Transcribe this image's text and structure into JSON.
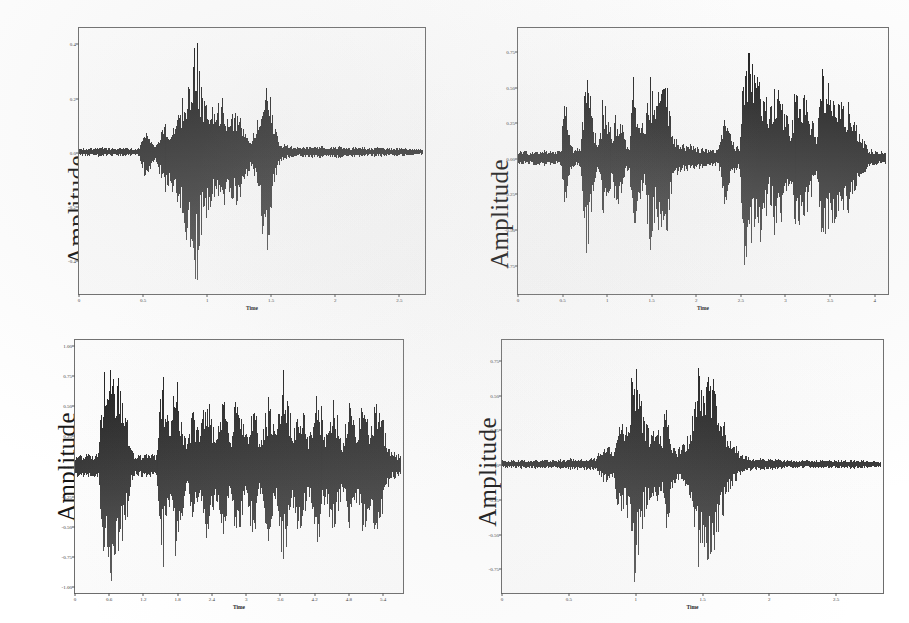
{
  "figure": {
    "kind": "speech-waveform-panel-figure",
    "panel_count": 4,
    "background_color": "#ffffff",
    "waveform_color": "#111111",
    "axis_color": "#6d6d6d"
  },
  "chart_data": [
    {
      "id": "panel-top-left",
      "type": "line",
      "title": "",
      "xlabel": "Time",
      "ylabel": "Amplitude",
      "xlim": [
        0,
        2.7
      ],
      "ylim": [
        -0.52,
        0.46
      ],
      "xticks": [
        0,
        0.5,
        1,
        1.5,
        2,
        2.5
      ],
      "xticklabels": [
        "0",
        "0.5",
        "1",
        "1.5",
        "2",
        "2.5"
      ],
      "yticks": [
        0.4,
        0.2,
        0.0,
        -0.2,
        -0.4
      ],
      "yticklabels": [
        "0.4",
        "0.2",
        "0.0",
        "-0.2",
        "-0.4"
      ],
      "grid": false,
      "legend": "none",
      "envelope_x": [
        0.0,
        0.05,
        0.1,
        0.16,
        0.22,
        0.28,
        0.34,
        0.4,
        0.46,
        0.52,
        0.56,
        0.6,
        0.64,
        0.68,
        0.72,
        0.76,
        0.8,
        0.84,
        0.88,
        0.92,
        0.96,
        1.0,
        1.04,
        1.08,
        1.12,
        1.16,
        1.2,
        1.24,
        1.28,
        1.32,
        1.36,
        1.4,
        1.44,
        1.48,
        1.52,
        1.56,
        1.6,
        1.66,
        1.72,
        1.8,
        1.88,
        1.96,
        2.04,
        2.12,
        2.2,
        2.28,
        2.36,
        2.44,
        2.52,
        2.6,
        2.7
      ],
      "envelope_pos": [
        0.012,
        0.016,
        0.014,
        0.02,
        0.016,
        0.013,
        0.018,
        0.015,
        0.014,
        0.09,
        0.05,
        0.03,
        0.085,
        0.12,
        0.09,
        0.15,
        0.19,
        0.23,
        0.3,
        0.43,
        0.25,
        0.2,
        0.18,
        0.16,
        0.23,
        0.17,
        0.14,
        0.16,
        0.13,
        0.08,
        0.06,
        0.12,
        0.25,
        0.3,
        0.15,
        0.06,
        0.03,
        0.022,
        0.018,
        0.02,
        0.024,
        0.018,
        0.022,
        0.016,
        0.02,
        0.015,
        0.018,
        0.014,
        0.016,
        0.012,
        0.01
      ],
      "envelope_neg": [
        0.012,
        0.016,
        0.014,
        0.02,
        0.016,
        0.013,
        0.018,
        0.015,
        0.014,
        0.11,
        0.06,
        0.04,
        0.11,
        0.15,
        0.12,
        0.2,
        0.26,
        0.32,
        0.4,
        0.51,
        0.33,
        0.25,
        0.22,
        0.2,
        0.28,
        0.21,
        0.18,
        0.2,
        0.17,
        0.1,
        0.07,
        0.16,
        0.33,
        0.4,
        0.19,
        0.07,
        0.035,
        0.024,
        0.02,
        0.022,
        0.026,
        0.02,
        0.024,
        0.018,
        0.022,
        0.016,
        0.02,
        0.015,
        0.017,
        0.013,
        0.01
      ]
    },
    {
      "id": "panel-top-right",
      "type": "line",
      "title": "",
      "xlabel": "Time",
      "ylabel": "Amplitude",
      "xlim": [
        0,
        4.15
      ],
      "ylim": [
        -0.95,
        0.92
      ],
      "xticks": [
        0,
        0.5,
        1,
        1.5,
        2,
        2.5,
        3,
        3.5,
        4
      ],
      "xticklabels": [
        "0",
        "0.5",
        "1",
        "1.5",
        "2",
        "2.5",
        "3",
        "3.5",
        "4"
      ],
      "yticks": [
        0.75,
        0.5,
        0.25,
        0.0,
        -0.25,
        -0.5,
        -0.75
      ],
      "yticklabels": [
        "0.75",
        "0.50",
        "0.25",
        "0.00",
        "-0.25",
        "-0.50",
        "-0.75"
      ],
      "grid": false,
      "legend": "none",
      "envelope_x": [
        0.0,
        0.1,
        0.2,
        0.3,
        0.4,
        0.48,
        0.52,
        0.56,
        0.62,
        0.7,
        0.76,
        0.8,
        0.84,
        0.9,
        0.96,
        1.02,
        1.06,
        1.1,
        1.16,
        1.22,
        1.26,
        1.3,
        1.36,
        1.42,
        1.48,
        1.52,
        1.56,
        1.62,
        1.68,
        1.74,
        1.8,
        1.86,
        1.92,
        1.98,
        2.04,
        2.1,
        2.18,
        2.26,
        2.34,
        2.42,
        2.5,
        2.56,
        2.6,
        2.66,
        2.72,
        2.78,
        2.84,
        2.9,
        2.96,
        3.02,
        3.08,
        3.14,
        3.2,
        3.26,
        3.32,
        3.38,
        3.44,
        3.5,
        3.56,
        3.62,
        3.68,
        3.74,
        3.8,
        3.88,
        3.96,
        4.05,
        4.15
      ],
      "envelope_pos": [
        0.05,
        0.05,
        0.05,
        0.05,
        0.05,
        0.06,
        0.52,
        0.2,
        0.06,
        0.08,
        0.66,
        0.6,
        0.25,
        0.09,
        0.46,
        0.3,
        0.16,
        0.33,
        0.3,
        0.12,
        0.08,
        0.62,
        0.38,
        0.18,
        0.55,
        0.5,
        0.4,
        0.52,
        0.5,
        0.22,
        0.12,
        0.1,
        0.1,
        0.09,
        0.08,
        0.07,
        0.06,
        0.06,
        0.3,
        0.12,
        0.08,
        0.9,
        0.78,
        0.62,
        0.72,
        0.45,
        0.3,
        0.55,
        0.5,
        0.36,
        0.22,
        0.58,
        0.56,
        0.44,
        0.3,
        0.16,
        0.64,
        0.6,
        0.5,
        0.46,
        0.42,
        0.38,
        0.3,
        0.16,
        0.07,
        0.05,
        0.05
      ],
      "envelope_neg": [
        0.05,
        0.05,
        0.05,
        0.05,
        0.05,
        0.06,
        0.4,
        0.18,
        0.06,
        0.08,
        0.72,
        0.62,
        0.26,
        0.09,
        0.42,
        0.28,
        0.15,
        0.36,
        0.32,
        0.12,
        0.08,
        0.58,
        0.4,
        0.18,
        0.62,
        0.56,
        0.42,
        0.58,
        0.54,
        0.24,
        0.12,
        0.1,
        0.1,
        0.09,
        0.08,
        0.07,
        0.06,
        0.06,
        0.34,
        0.12,
        0.08,
        0.95,
        0.7,
        0.58,
        0.66,
        0.42,
        0.28,
        0.6,
        0.52,
        0.34,
        0.22,
        0.56,
        0.52,
        0.42,
        0.28,
        0.16,
        0.6,
        0.56,
        0.48,
        0.44,
        0.4,
        0.36,
        0.28,
        0.15,
        0.07,
        0.05,
        0.05
      ]
    },
    {
      "id": "panel-bottom-left",
      "type": "line",
      "title": "",
      "xlabel": "Time",
      "ylabel": "Amplitude",
      "xlim": [
        0,
        5.75
      ],
      "ylim": [
        -1.05,
        1.05
      ],
      "xticks": [
        0,
        0.6,
        1.2,
        1.8,
        2.4,
        3,
        3.6,
        4.2,
        4.8,
        5.4
      ],
      "xticklabels": [
        "0",
        "0.6",
        "1.2",
        "1.8",
        "2.4",
        "3",
        "3.6",
        "4.2",
        "4.8",
        "5.4"
      ],
      "yticks": [
        1.0,
        0.75,
        0.5,
        0.25,
        0.0,
        -0.25,
        -0.5,
        -0.75,
        -1.0
      ],
      "yticklabels": [
        "1.00",
        "0.75",
        "0.50",
        "0.25",
        "0.00",
        "-0.25",
        "-0.50",
        "-0.75",
        "-1.00"
      ],
      "grid": false,
      "legend": "none",
      "envelope_x": [
        0.0,
        0.1,
        0.2,
        0.3,
        0.4,
        0.46,
        0.52,
        0.58,
        0.64,
        0.7,
        0.76,
        0.82,
        0.88,
        0.94,
        1.0,
        1.06,
        1.12,
        1.2,
        1.28,
        1.36,
        1.44,
        1.5,
        1.56,
        1.62,
        1.68,
        1.74,
        1.8,
        1.86,
        1.92,
        1.98,
        2.04,
        2.1,
        2.16,
        2.22,
        2.28,
        2.34,
        2.4,
        2.46,
        2.52,
        2.58,
        2.64,
        2.7,
        2.76,
        2.82,
        2.88,
        2.94,
        3.0,
        3.06,
        3.12,
        3.18,
        3.24,
        3.3,
        3.36,
        3.42,
        3.48,
        3.54,
        3.6,
        3.66,
        3.72,
        3.78,
        3.84,
        3.9,
        3.96,
        4.02,
        4.08,
        4.14,
        4.2,
        4.26,
        4.32,
        4.38,
        4.44,
        4.5,
        4.56,
        4.62,
        4.68,
        4.74,
        4.8,
        4.86,
        4.92,
        4.98,
        5.04,
        5.1,
        5.16,
        5.22,
        5.28,
        5.34,
        5.4,
        5.46,
        5.52,
        5.6,
        5.68,
        5.75
      ],
      "envelope_pos": [
        0.1,
        0.1,
        0.1,
        0.1,
        0.1,
        0.55,
        0.95,
        0.8,
        1.0,
        0.7,
        0.88,
        0.6,
        0.45,
        0.3,
        0.12,
        0.1,
        0.1,
        0.1,
        0.1,
        0.1,
        0.1,
        0.58,
        0.72,
        0.5,
        0.3,
        0.66,
        0.8,
        0.55,
        0.35,
        0.18,
        0.4,
        0.48,
        0.36,
        0.3,
        0.55,
        0.65,
        0.45,
        0.26,
        0.32,
        0.6,
        0.58,
        0.4,
        0.24,
        0.52,
        0.62,
        0.44,
        0.28,
        0.34,
        0.58,
        0.5,
        0.32,
        0.2,
        0.48,
        0.56,
        0.42,
        0.26,
        0.55,
        0.9,
        0.78,
        0.52,
        0.36,
        0.46,
        0.6,
        0.54,
        0.38,
        0.24,
        0.5,
        0.7,
        0.58,
        0.4,
        0.26,
        0.44,
        0.62,
        0.5,
        0.34,
        0.22,
        0.4,
        0.58,
        0.46,
        0.3,
        0.44,
        0.56,
        0.48,
        0.34,
        0.5,
        0.62,
        0.52,
        0.36,
        0.2,
        0.12,
        0.1,
        0.1
      ],
      "envelope_neg": [
        0.1,
        0.1,
        0.1,
        0.1,
        0.1,
        0.6,
        0.9,
        0.85,
        1.02,
        0.75,
        0.92,
        0.66,
        0.48,
        0.32,
        0.12,
        0.1,
        0.1,
        0.1,
        0.1,
        0.1,
        0.1,
        0.62,
        0.8,
        0.55,
        0.32,
        0.7,
        0.86,
        0.58,
        0.38,
        0.18,
        0.44,
        0.52,
        0.38,
        0.32,
        0.6,
        0.7,
        0.48,
        0.28,
        0.34,
        0.64,
        0.62,
        0.42,
        0.26,
        0.56,
        0.66,
        0.46,
        0.3,
        0.36,
        0.62,
        0.54,
        0.34,
        0.22,
        0.52,
        0.6,
        0.44,
        0.28,
        0.6,
        0.96,
        0.82,
        0.56,
        0.38,
        0.5,
        0.64,
        0.58,
        0.4,
        0.26,
        0.54,
        0.74,
        0.62,
        0.42,
        0.28,
        0.48,
        0.66,
        0.54,
        0.36,
        0.24,
        0.44,
        0.62,
        0.5,
        0.32,
        0.48,
        0.6,
        0.52,
        0.36,
        0.54,
        0.66,
        0.56,
        0.38,
        0.22,
        0.12,
        0.1,
        0.1
      ]
    },
    {
      "id": "panel-bottom-right",
      "type": "line",
      "title": "",
      "xlabel": "Time",
      "ylabel": "Amplitude",
      "xlim": [
        0,
        2.85
      ],
      "ylim": [
        -0.92,
        0.9
      ],
      "xticks": [
        0,
        0.5,
        1,
        1.5,
        2,
        2.5
      ],
      "xticklabels": [
        "0",
        "0.5",
        "1",
        "1.5",
        "2",
        "2.5"
      ],
      "yticks": [
        0.75,
        0.5,
        0.25,
        0.0,
        -0.25,
        -0.5,
        -0.75
      ],
      "yticklabels": [
        "0.75",
        "0.50",
        "0.25",
        "0.00",
        "-0.25",
        "-0.50",
        "-0.75"
      ],
      "grid": false,
      "legend": "none",
      "envelope_x": [
        0.0,
        0.1,
        0.2,
        0.3,
        0.4,
        0.5,
        0.6,
        0.7,
        0.76,
        0.8,
        0.84,
        0.88,
        0.92,
        0.96,
        1.0,
        1.04,
        1.08,
        1.12,
        1.16,
        1.2,
        1.24,
        1.28,
        1.32,
        1.36,
        1.4,
        1.44,
        1.48,
        1.52,
        1.56,
        1.6,
        1.64,
        1.68,
        1.72,
        1.76,
        1.8,
        1.84,
        1.88,
        1.92,
        1.96,
        2.0,
        2.06,
        2.12,
        2.2,
        2.3,
        2.4,
        2.5,
        2.6,
        2.7,
        2.85
      ],
      "envelope_pos": [
        0.03,
        0.03,
        0.03,
        0.03,
        0.03,
        0.04,
        0.04,
        0.05,
        0.12,
        0.14,
        0.1,
        0.4,
        0.3,
        0.48,
        0.88,
        0.55,
        0.35,
        0.25,
        0.3,
        0.2,
        0.5,
        0.18,
        0.12,
        0.14,
        0.22,
        0.4,
        0.66,
        0.58,
        0.7,
        0.6,
        0.44,
        0.3,
        0.18,
        0.12,
        0.08,
        0.06,
        0.05,
        0.04,
        0.04,
        0.04,
        0.04,
        0.03,
        0.03,
        0.03,
        0.03,
        0.03,
        0.03,
        0.03,
        0.02
      ],
      "envelope_neg": [
        0.03,
        0.03,
        0.03,
        0.03,
        0.03,
        0.04,
        0.04,
        0.05,
        0.13,
        0.15,
        0.11,
        0.44,
        0.32,
        0.52,
        0.92,
        0.58,
        0.36,
        0.26,
        0.32,
        0.22,
        0.54,
        0.2,
        0.12,
        0.15,
        0.24,
        0.44,
        0.7,
        0.62,
        0.76,
        0.66,
        0.48,
        0.32,
        0.19,
        0.12,
        0.08,
        0.06,
        0.05,
        0.04,
        0.04,
        0.04,
        0.04,
        0.03,
        0.03,
        0.03,
        0.03,
        0.03,
        0.03,
        0.03,
        0.02
      ]
    }
  ]
}
